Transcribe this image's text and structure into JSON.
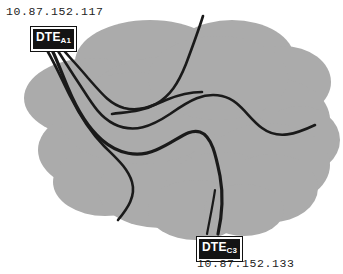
{
  "diagram": {
    "type": "network-cloud",
    "background_color": "#ffffff",
    "cloud": {
      "name": "network-cloud",
      "fill_color": "#ababab",
      "description": "gray cloud shape representing the network"
    },
    "line_color": "#1a1a1a",
    "paths_count": 5
  },
  "nodes": [
    {
      "id": "dte-a1",
      "name": "DTE",
      "subscript": "A1",
      "ip": "10.87.152.117",
      "position": "top-left"
    },
    {
      "id": "dte-c3",
      "name": "DTE",
      "subscript": "C3",
      "ip": "10.87.152.133",
      "position": "bottom-right"
    }
  ],
  "labels": {
    "top_ip": "10.87.152.117",
    "bottom_ip": "10.87.152.133",
    "dte_a1_text": "DTE",
    "dte_a1_sub": "A1",
    "dte_c3_text": "DTE",
    "dte_c3_sub": "C3"
  }
}
